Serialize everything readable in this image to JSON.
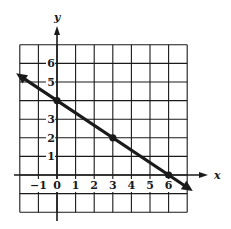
{
  "chart_data": {
    "type": "line",
    "title": "",
    "xlabel": "x",
    "ylabel": "y",
    "xlim": [
      -2,
      7
    ],
    "ylim": [
      -2,
      7
    ],
    "grid": true,
    "x_ticks": [
      "-1",
      "0",
      "1",
      "2",
      "3",
      "4",
      "5",
      "6"
    ],
    "x_tick_values": [
      -1,
      0,
      1,
      2,
      3,
      4,
      5,
      6
    ],
    "y_ticks": [
      "1",
      "2",
      "3",
      "5",
      "6"
    ],
    "y_tick_values": [
      1,
      2,
      3,
      5,
      6
    ],
    "series": [
      {
        "name": "line",
        "equation": "y = -2/3 x + 4",
        "points": [
          [
            0,
            4
          ],
          [
            3,
            2
          ],
          [
            6,
            0
          ]
        ],
        "x_range": [
          -2.2,
          7.3
        ],
        "arrows_both_ends": true
      }
    ],
    "marked_points": [
      [
        0,
        4
      ],
      [
        3,
        2
      ],
      [
        6,
        0
      ]
    ],
    "legend": null
  },
  "colors": {
    "ink": "#1a1a1a",
    "background": "#ffffff"
  }
}
